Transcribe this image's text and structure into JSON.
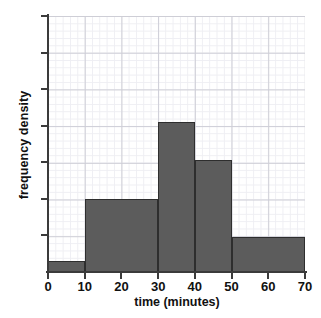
{
  "chart_data": {
    "type": "bar",
    "title": "",
    "subtitle": "",
    "xlabel": "time (minutes)",
    "ylabel": "frequency density",
    "grid": true,
    "legend": "none",
    "xlim": [
      0,
      70
    ],
    "ylim": [
      0,
      7
    ],
    "xticks": [
      0,
      10,
      20,
      30,
      40,
      50,
      60,
      70
    ],
    "xticklabels": [
      "0",
      "10",
      "20",
      "30",
      "40",
      "50",
      "60",
      "70"
    ],
    "yticks": [
      1,
      2,
      3,
      4,
      5,
      6,
      7
    ],
    "yticklabels": [
      "",
      "",
      "",
      "",
      "",
      "",
      ""
    ],
    "bin_edges": [
      0,
      10,
      30,
      40,
      50,
      70
    ],
    "categories": [
      "0-10",
      "10-30",
      "30-40",
      "40-50",
      "50-70"
    ],
    "values": [
      0.3,
      2.0,
      4.1,
      3.05,
      0.95
    ],
    "bars": [
      {
        "label": "0-10",
        "x0": 0,
        "x1": 10,
        "height": 0.3
      },
      {
        "label": "10-30",
        "x0": 10,
        "x1": 30,
        "height": 2.0
      },
      {
        "label": "30-40",
        "x0": 30,
        "x1": 40,
        "height": 4.1
      },
      {
        "label": "40-50",
        "x0": 40,
        "x1": 50,
        "height": 3.05
      },
      {
        "label": "50-70",
        "x0": 50,
        "x1": 70,
        "height": 0.95
      }
    ],
    "bar_color": "#5c5c5c",
    "bar_edge_color": "#2e2e2e",
    "axis_color": "#3b3b3b",
    "grid_major_color": "#c9c9d2",
    "grid_minor_color": "#ededf2"
  },
  "axes": {
    "x_title": "time (minutes)",
    "y_title": "frequency density"
  }
}
